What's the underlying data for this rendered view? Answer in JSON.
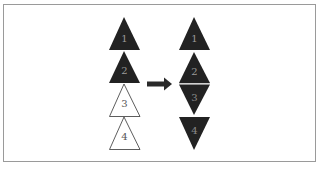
{
  "diagram": {
    "type": "triangle-stack-transformation",
    "colors": {
      "filled": "#222222",
      "outline": "#333333",
      "label_on_dark": "#9a9a9a",
      "label_on_light": "#555555",
      "border": "#9a9a9a"
    },
    "before": {
      "triangles": [
        {
          "label": "1",
          "orientation": "up",
          "fill": "dark"
        },
        {
          "label": "2",
          "orientation": "up",
          "fill": "dark"
        },
        {
          "label": "3",
          "orientation": "up",
          "fill": "outline"
        },
        {
          "label": "4",
          "orientation": "up",
          "fill": "outline"
        }
      ]
    },
    "arrow": {
      "direction": "right",
      "icon": "right-arrow-icon"
    },
    "after": {
      "triangles": [
        {
          "label": "1",
          "orientation": "up",
          "fill": "dark"
        },
        {
          "label": "2",
          "orientation": "up",
          "fill": "dark"
        },
        {
          "label": "3",
          "orientation": "down",
          "fill": "dark"
        },
        {
          "label": "4",
          "orientation": "down",
          "fill": "dark"
        }
      ]
    }
  }
}
